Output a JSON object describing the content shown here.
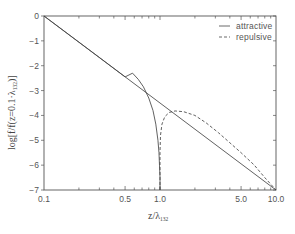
{
  "chart_data": {
    "type": "line",
    "title": "",
    "xlabel": "z/λ132",
    "xlabel_main": "z/λ",
    "xlabel_sub": "132",
    "ylabel": "log[f/f(z=0.1λ132)]",
    "ylabel_main_pre": "log[f/f(z=0.1·λ",
    "ylabel_sub": "132",
    "ylabel_main_post": ")]",
    "xscale": "log",
    "xlim": [
      0.1,
      10.0
    ],
    "ylim": [
      -7,
      0
    ],
    "xticks": [
      {
        "value": 0.1,
        "label": "0.1"
      },
      {
        "value": 0.5,
        "label": "0.5"
      },
      {
        "value": 1.0,
        "label": "1.0"
      },
      {
        "value": 5.0,
        "label": "5.0"
      },
      {
        "value": 10.0,
        "label": "10.0"
      }
    ],
    "yticks": [
      {
        "value": 0,
        "label": "0"
      },
      {
        "value": -1,
        "label": "-1"
      },
      {
        "value": -2,
        "label": "-2"
      },
      {
        "value": -3,
        "label": "-3"
      },
      {
        "value": -4,
        "label": "-4"
      },
      {
        "value": -5,
        "label": "-5"
      },
      {
        "value": -6,
        "label": "-6"
      },
      {
        "value": -7,
        "label": "-7"
      }
    ],
    "grid": false,
    "legend_position": "upper right",
    "series": [
      {
        "name": "reference (z^-3.5)",
        "style": "solid",
        "legend": false,
        "x": [
          0.1,
          10.0
        ],
        "y": [
          0,
          -7
        ]
      },
      {
        "name": "attractive",
        "style": "solid",
        "legend": true,
        "x": [
          0.1,
          0.3,
          0.5,
          0.58,
          0.65,
          0.72,
          0.8,
          0.87,
          0.92,
          0.96,
          0.98,
          0.99,
          1.0,
          1.0
        ],
        "y": [
          0,
          -1.67,
          -2.45,
          -2.3,
          -2.55,
          -2.85,
          -3.3,
          -3.8,
          -4.35,
          -5.0,
          -5.5,
          -6.0,
          -6.5,
          -7.0
        ]
      },
      {
        "name": "repulsive",
        "style": "dashed",
        "legend": true,
        "x": [
          1.0,
          1.0,
          1.01,
          1.04,
          1.1,
          1.2,
          1.35,
          1.6,
          2.0,
          2.5,
          3.2,
          4.0,
          5.0,
          6.5,
          8.0,
          10.0
        ],
        "y": [
          -7.0,
          -5.5,
          -4.8,
          -4.35,
          -4.05,
          -3.88,
          -3.82,
          -3.85,
          -4.0,
          -4.3,
          -4.7,
          -5.1,
          -5.5,
          -6.0,
          -6.5,
          -7.0
        ]
      }
    ],
    "legend": [
      {
        "label": "attractive",
        "style": "solid"
      },
      {
        "label": "repulsive",
        "style": "dashed"
      }
    ]
  },
  "colors": {
    "axis": "#555555",
    "line": "#444444",
    "background": "#ffffff"
  }
}
